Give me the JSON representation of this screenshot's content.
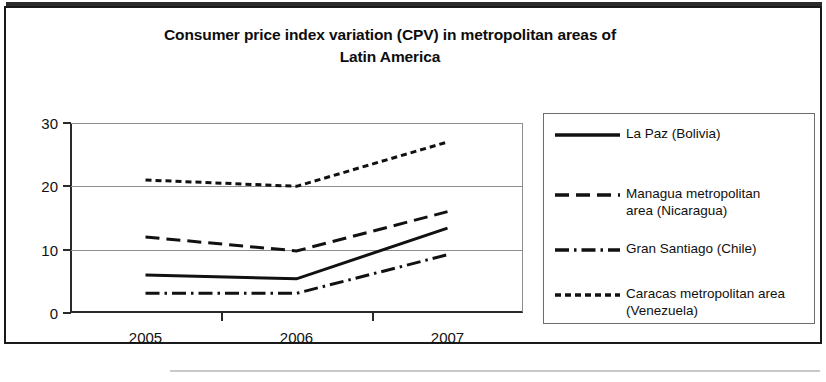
{
  "chart_data": {
    "type": "line",
    "title": "Consumer price index variation (CPV) in metropolitan areas of Latin America",
    "title_line_1": "Consumer price index variation (CPV) in metropolitan areas of",
    "title_line_2": "Latin America",
    "xlabel": "",
    "ylabel": "",
    "categories": [
      "2005",
      "2006",
      "2007"
    ],
    "x_tick_labels": [
      "2005",
      "2006",
      "2007"
    ],
    "y_tick_labels": [
      "0",
      "10",
      "20",
      "30"
    ],
    "y_ticks": [
      0,
      10,
      20,
      30
    ],
    "ylim": [
      0,
      30
    ],
    "grid": true,
    "legend_position": "right",
    "series": [
      {
        "name": "La Paz (Bolivia)",
        "line_style": "solid",
        "color": "#111111",
        "values": [
          6,
          5.4,
          13.4
        ]
      },
      {
        "name": "Managua metropolitan area (Nicaragua)",
        "legend_line_1": "Managua metropolitan",
        "legend_line_2": "area (Nicaragua)",
        "line_style": "dashed",
        "color": "#111111",
        "values": [
          12,
          9.8,
          16
        ]
      },
      {
        "name": "Gran Santiago (Chile)",
        "line_style": "dash-dot",
        "color": "#111111",
        "values": [
          3.1,
          3.1,
          9.2
        ]
      },
      {
        "name": "Caracas metropolitan area (Venezuela)",
        "legend_line_1": "Caracas metropolitan area",
        "legend_line_2": "(Venezuela)",
        "line_style": "dotted",
        "color": "#111111",
        "values": [
          21,
          20,
          27
        ]
      }
    ]
  },
  "legend": {
    "items": [
      {
        "label": "La Paz (Bolivia)"
      },
      {
        "label": "Managua metropolitan\narea (Nicaragua)"
      },
      {
        "label": "Gran Santiago (Chile)"
      },
      {
        "label": "Caracas metropolitan area\n(Venezuela)"
      }
    ]
  }
}
